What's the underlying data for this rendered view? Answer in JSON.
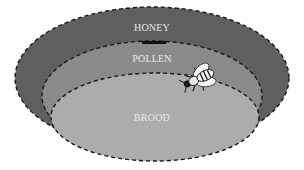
{
  "diagram": {
    "zones": [
      {
        "id": "honey",
        "label": "HONEY",
        "color": "#5f5f5f"
      },
      {
        "id": "pollen",
        "label": "POLLEN",
        "color": "#8a8a8a"
      },
      {
        "id": "brood",
        "label": "BROOD",
        "color": "#acacac"
      }
    ],
    "figure": {
      "name": "bee",
      "position": "boundary between pollen and brood, right side"
    },
    "border_style": "dashed",
    "border_color": "#1a1a1a"
  }
}
